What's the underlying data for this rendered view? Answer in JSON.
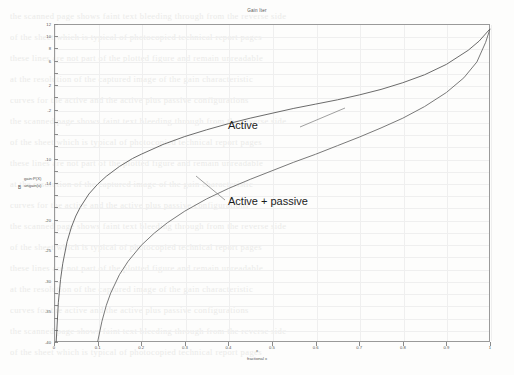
{
  "chart_data": {
    "type": "line",
    "title": "Gain Iter",
    "xlabel": "fractional x",
    "xvar": "x",
    "ylabel_line1": "gain:P(X)",
    "ylabel_line2": "ungain(x)",
    "yvar": "B",
    "xlim": [
      0,
      1
    ],
    "ylim": [
      -40,
      12
    ],
    "xticks": [
      0,
      0.1,
      0.2,
      0.3,
      0.4,
      0.5,
      0.6,
      0.7,
      0.8,
      0.9,
      1
    ],
    "xticklabels": [
      "0",
      "0.1",
      "0.2",
      "0.3",
      "0.4",
      "0.5",
      "0.6",
      "0.7",
      "0.8",
      "0.9",
      "1"
    ],
    "yticks": [
      12,
      10,
      8,
      6,
      4,
      2,
      0,
      -2,
      -4,
      -6,
      -8,
      -10,
      -12,
      -14,
      -16,
      -18,
      -20,
      -22,
      -24,
      -26,
      -28,
      -30,
      -32,
      -34,
      -36,
      -38,
      -40
    ],
    "yticklabels_shown": [
      {
        "value": 12,
        "label": "12"
      },
      {
        "value": 10,
        "label": "10"
      },
      {
        "value": 8,
        "label": "8"
      },
      {
        "value": 6,
        "label": "6"
      },
      {
        "value": 2,
        "label": "2"
      },
      {
        "value": -2,
        "label": "-2"
      },
      {
        "value": -10,
        "label": "-10"
      },
      {
        "value": -14,
        "label": "-14"
      },
      {
        "value": -20,
        "label": "-20"
      },
      {
        "value": -25,
        "label": "-25"
      },
      {
        "value": -30,
        "label": "-30"
      },
      {
        "value": -35,
        "label": "-35"
      },
      {
        "value": -40,
        "label": "-40"
      }
    ],
    "grid": true,
    "legend": "inline-annotations",
    "series": [
      {
        "name": "Active",
        "annotation": "Active",
        "color": "#5a5a5a",
        "points": [
          [
            0.005,
            -40.0
          ],
          [
            0.01,
            -33.5
          ],
          [
            0.015,
            -29.8
          ],
          [
            0.02,
            -27.2
          ],
          [
            0.03,
            -23.6
          ],
          [
            0.04,
            -21.2
          ],
          [
            0.05,
            -19.4
          ],
          [
            0.06,
            -18.0
          ],
          [
            0.08,
            -15.8
          ],
          [
            0.1,
            -14.2
          ],
          [
            0.12,
            -12.9
          ],
          [
            0.15,
            -11.3
          ],
          [
            0.18,
            -10.0
          ],
          [
            0.2,
            -9.3
          ],
          [
            0.25,
            -7.7
          ],
          [
            0.3,
            -6.4
          ],
          [
            0.35,
            -5.3
          ],
          [
            0.4,
            -4.3
          ],
          [
            0.45,
            -3.4
          ],
          [
            0.5,
            -2.6
          ],
          [
            0.55,
            -1.8
          ],
          [
            0.6,
            -1.1
          ],
          [
            0.65,
            -0.4
          ],
          [
            0.7,
            0.4
          ],
          [
            0.75,
            1.3
          ],
          [
            0.8,
            2.4
          ],
          [
            0.85,
            3.7
          ],
          [
            0.9,
            5.4
          ],
          [
            0.95,
            7.7
          ],
          [
            0.975,
            9.2
          ],
          [
            1.0,
            11.2
          ]
        ]
      },
      {
        "name": "Active + passive",
        "annotation": "Active + passive",
        "color": "#6a6a6a",
        "points": [
          [
            0.1,
            -40.0
          ],
          [
            0.11,
            -36.6
          ],
          [
            0.12,
            -34.0
          ],
          [
            0.13,
            -32.0
          ],
          [
            0.15,
            -29.0
          ],
          [
            0.17,
            -26.8
          ],
          [
            0.2,
            -24.2
          ],
          [
            0.23,
            -22.2
          ],
          [
            0.26,
            -20.5
          ],
          [
            0.3,
            -18.6
          ],
          [
            0.35,
            -16.6
          ],
          [
            0.4,
            -14.9
          ],
          [
            0.45,
            -13.4
          ],
          [
            0.5,
            -12.0
          ],
          [
            0.55,
            -10.6
          ],
          [
            0.6,
            -9.3
          ],
          [
            0.65,
            -7.9
          ],
          [
            0.7,
            -6.5
          ],
          [
            0.75,
            -5.0
          ],
          [
            0.8,
            -3.4
          ],
          [
            0.85,
            -1.5
          ],
          [
            0.9,
            0.8
          ],
          [
            0.94,
            3.2
          ],
          [
            0.97,
            5.8
          ],
          [
            0.99,
            9.0
          ],
          [
            1.0,
            11.2
          ]
        ]
      }
    ]
  },
  "background_bleed": [
    "the scanned page shows faint text bleeding through from the reverse side",
    "of the sheet which is typical of photocopied technical report pages",
    "these lines are not part of the plotted figure and remain unreadable",
    "at the resolution of the captured image of the gain characteristic",
    "curves for the active and the active plus passive configurations"
  ]
}
